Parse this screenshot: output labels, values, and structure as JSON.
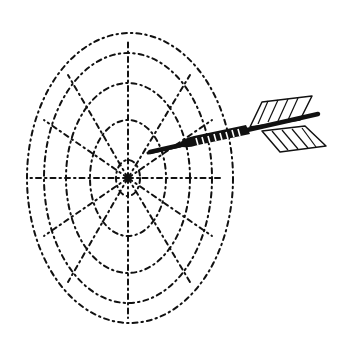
{
  "illustration": {
    "subject": "Dart hitting a dartboard",
    "colors": {
      "ink": "#111111",
      "background": "#ffffff"
    }
  }
}
